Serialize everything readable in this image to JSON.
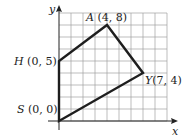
{
  "figure": {
    "axes": {
      "x_label": "x",
      "y_label": "y",
      "x_range": [
        0,
        9
      ],
      "y_range": [
        0,
        9
      ],
      "grid": true
    },
    "polygon": {
      "vertices": [
        {
          "name": "S",
          "coords": "(0, 0)",
          "x": 0,
          "y": 0
        },
        {
          "name": "H",
          "coords": "(0, 5)",
          "x": 0,
          "y": 5
        },
        {
          "name": "A",
          "coords": "(4, 8)",
          "x": 4,
          "y": 8
        },
        {
          "name": "Y",
          "coords": "(7, 4)",
          "x": 7,
          "y": 4
        }
      ]
    },
    "colors": {
      "grid": "#9a9a9a",
      "polygon": "#1e1e1e",
      "axis": "#222222"
    }
  }
}
